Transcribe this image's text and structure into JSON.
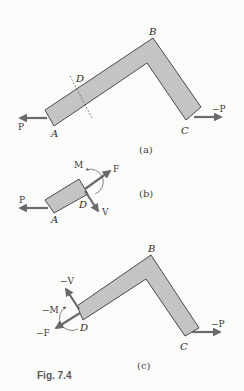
{
  "figure": {
    "caption": "Fig. 7.4",
    "colors": {
      "background": "#fbfbfa",
      "member_fill": "#c4c4c4",
      "member_stroke": "#3a3a3a",
      "arrow": "#6a6a6a"
    }
  },
  "panel_a": {
    "label": "(a)",
    "points": {
      "A": "A",
      "B": "B",
      "C": "C",
      "D": "D"
    },
    "forces": {
      "left": "P",
      "right": "−P"
    }
  },
  "panel_b": {
    "label": "(b)",
    "points": {
      "A": "A",
      "D": "D"
    },
    "forces": {
      "left": "P",
      "axial": "F",
      "shear": "V",
      "moment": "M"
    }
  },
  "panel_c": {
    "label": "(c)",
    "points": {
      "B": "B",
      "C": "C",
      "D": "D"
    },
    "forces": {
      "right": "−P",
      "axial": "−F",
      "shear": "−V",
      "moment": "−M"
    }
  }
}
